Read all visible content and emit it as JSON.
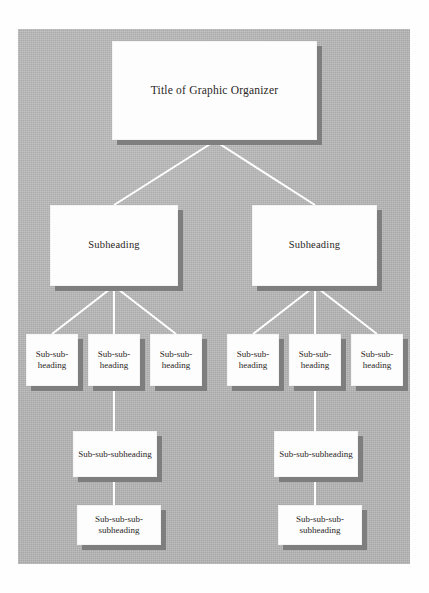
{
  "document": {
    "kind": "graphic-organizer-template",
    "panel_color": "#b6b6b6",
    "box_color": "#fdfdfd",
    "shadow_color": "#7e7e7e",
    "connector_color": "#ffffff",
    "text_color": "#2a2724"
  },
  "tree": {
    "title": {
      "label": "Title of Graphic Organizer"
    },
    "branches": [
      {
        "subheading": {
          "label": "Subheading"
        },
        "children": [
          {
            "label": "Sub-sub-heading"
          },
          {
            "label": "Sub-sub-heading"
          },
          {
            "label": "Sub-sub-heading"
          }
        ],
        "third_level": {
          "label": "Sub-sub-subheading"
        },
        "fourth_level": {
          "label": "Sub-sub-sub-subheading"
        }
      },
      {
        "subheading": {
          "label": "Subheading"
        },
        "children": [
          {
            "label": "Sub-sub-heading"
          },
          {
            "label": "Sub-sub-heading"
          },
          {
            "label": "Sub-sub-heading"
          }
        ],
        "third_level": {
          "label": "Sub-sub-subheading"
        },
        "fourth_level": {
          "label": "Sub-sub-sub-subheading"
        }
      }
    ]
  }
}
